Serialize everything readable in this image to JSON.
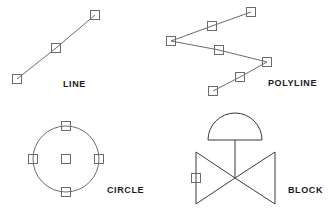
{
  "canvas": {
    "width": 328,
    "height": 208,
    "background_color": "#ffffff",
    "stroke_color": "#6b6b6b",
    "label_color": "#1a1a1a",
    "grip_size": 9
  },
  "entities": {
    "line": {
      "label": "LINE",
      "label_x": 63,
      "label_y": 80,
      "vertices": [
        {
          "x": 17,
          "y": 79
        },
        {
          "x": 56,
          "y": 48
        },
        {
          "x": 95,
          "y": 15
        }
      ],
      "grips": [
        {
          "x": 17,
          "y": 79
        },
        {
          "x": 56,
          "y": 48
        },
        {
          "x": 95,
          "y": 15
        }
      ]
    },
    "polyline": {
      "label": "POLYLINE",
      "label_x": 268,
      "label_y": 79,
      "vertices": [
        {
          "x": 251,
          "y": 12
        },
        {
          "x": 212,
          "y": 26
        },
        {
          "x": 171,
          "y": 41
        },
        {
          "x": 219,
          "y": 50
        },
        {
          "x": 267,
          "y": 62
        },
        {
          "x": 240,
          "y": 77
        },
        {
          "x": 213,
          "y": 91
        }
      ],
      "grips": [
        {
          "x": 251,
          "y": 12
        },
        {
          "x": 212,
          "y": 26
        },
        {
          "x": 171,
          "y": 41
        },
        {
          "x": 219,
          "y": 50
        },
        {
          "x": 267,
          "y": 62
        },
        {
          "x": 240,
          "y": 77
        },
        {
          "x": 213,
          "y": 91
        }
      ]
    },
    "circle": {
      "label": "CIRCLE",
      "label_x": 107,
      "label_y": 186,
      "center": {
        "x": 66,
        "y": 159
      },
      "radius": 33,
      "grips": [
        {
          "x": 66,
          "y": 159
        },
        {
          "x": 66,
          "y": 126
        },
        {
          "x": 99,
          "y": 159
        },
        {
          "x": 66,
          "y": 192
        },
        {
          "x": 33,
          "y": 159
        }
      ]
    },
    "block": {
      "label": "BLOCK",
      "label_x": 288,
      "label_y": 186,
      "dome": {
        "left_x": 208,
        "right_x": 262,
        "base_y": 140,
        "apex_y": 113
      },
      "stem": {
        "x": 235,
        "top_y": 140,
        "bottom_y": 178
      },
      "bowtie": {
        "left_x": 196,
        "right_x": 275,
        "top_y": 152,
        "bottom_y": 204,
        "center_x": 235,
        "center_y": 178
      },
      "grips": [
        {
          "x": 196,
          "y": 178
        }
      ]
    }
  }
}
